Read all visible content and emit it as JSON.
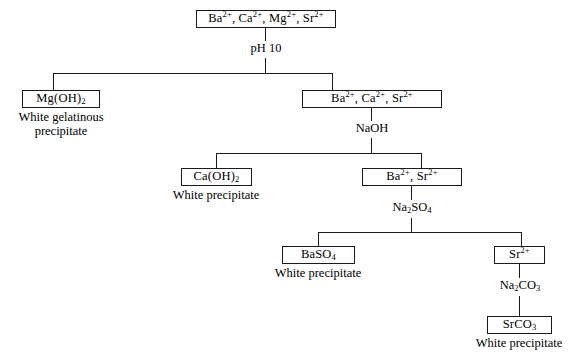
{
  "diagram": {
    "line_color": "#1a1a1a",
    "background": "#ffffff"
  },
  "nodes": {
    "root": {
      "id": "root",
      "label_html": "Ba<sup>2+</sup>, Ca<sup>2+</sup>, Mg<sup>2+</sup>, Sr<sup>2+</sup>",
      "label_text": "Ba2+, Ca2+, Mg2+, Sr2+"
    },
    "mg_hydroxide": {
      "id": "mg-hydroxide",
      "label_html": "Mg(OH)<sub>2</sub>",
      "label_text": "Mg(OH)2"
    },
    "ba_ca_sr": {
      "id": "ba-ca-sr",
      "label_html": "Ba<sup>2+</sup>, Ca<sup>2+</sup>, Sr<sup>2+</sup>",
      "label_text": "Ba2+, Ca2+, Sr2+"
    },
    "ca_hydroxide": {
      "id": "ca-hydroxide",
      "label_html": "Ca(OH)<sub>2</sub>",
      "label_text": "Ca(OH)2"
    },
    "ba_sr": {
      "id": "ba-sr",
      "label_html": "Ba<sup>2+</sup>, Sr<sup>2+</sup>",
      "label_text": "Ba2+, Sr2+"
    },
    "ba_sulfate": {
      "id": "ba-sulfate",
      "label_html": "BaSO<sub>4</sub>",
      "label_text": "BaSO4"
    },
    "sr_ion": {
      "id": "sr-ion",
      "label_html": "Sr<sup>2+</sup>",
      "label_text": "Sr2+"
    },
    "sr_carbonate": {
      "id": "sr-carbonate",
      "label_html": "SrCO<sub>3</sub>",
      "label_text": "SrCO3"
    }
  },
  "reagents": {
    "ph10": {
      "label_html": "pH 10",
      "label_text": "pH 10"
    },
    "naoh": {
      "label_html": "NaOH",
      "label_text": "NaOH"
    },
    "na2so4": {
      "label_html": "Na<sub>2</sub>SO<sub>4</sub>",
      "label_text": "Na2SO4"
    },
    "na2co3": {
      "label_html": "Na<sub>2</sub>CO<sub>3</sub>",
      "label_text": "Na2CO3"
    }
  },
  "captions": {
    "mg_hydroxide": {
      "line1": "White gelatinous",
      "line2": "precipitate",
      "full": "White gelatinous precipitate"
    },
    "ca_hydroxide": {
      "full": "White precipitate"
    },
    "ba_sulfate": {
      "full": "White precipitate"
    },
    "sr_carbonate": {
      "full": "White precipitate"
    }
  }
}
